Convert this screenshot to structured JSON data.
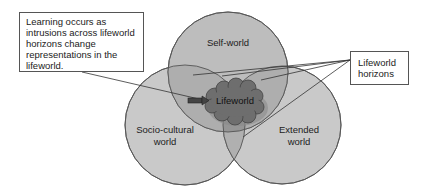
{
  "diagram": {
    "note": {
      "text": "Learning occurs as intrusions across lifeworld horizons change representations in the lifeworld."
    },
    "horizons_label": {
      "text": "Lifeworld horizons"
    },
    "circles": {
      "self": {
        "label": "Self-world"
      },
      "socio": {
        "label_line1": "Socio-cultural",
        "label_line2": "world"
      },
      "extended": {
        "label_line1": "Extended",
        "label_line2": "world"
      }
    },
    "center": {
      "label": "Lifeworld"
    },
    "colors": {
      "circle_fill": "#c4c4c4",
      "overlap_fill": "#a9a9a9",
      "cloud_fill": "#6e6e6e",
      "stroke": "#555555"
    }
  }
}
